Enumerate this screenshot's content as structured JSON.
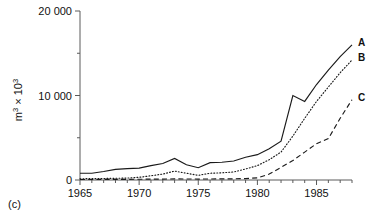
{
  "caption": "(c)",
  "chart_data": {
    "type": "line",
    "title": "",
    "xlabel": "",
    "ylabel": "m3 x 103",
    "ylabel_parts": {
      "base1": "m",
      "sup1": "3",
      "mid": " × 10",
      "sup2": "3"
    },
    "xlim": [
      1965,
      1988
    ],
    "ylim": [
      0,
      20000
    ],
    "grid": false,
    "legend_position": "right-end-of-lines",
    "y_ticks_major": [
      0,
      10000,
      20000
    ],
    "y_ticklabels": [
      "0",
      "10 000",
      "20 000"
    ],
    "y_ticks_minor": [
      5000,
      15000
    ],
    "x_ticks_major": [
      1965,
      1970,
      1975,
      1980,
      1985
    ],
    "x_ticklabels": [
      "1965",
      "1970",
      "1975",
      "1980",
      "1985"
    ],
    "x_ticks_minor": [
      1966,
      1967,
      1968,
      1969,
      1971,
      1972,
      1973,
      1974,
      1976,
      1977,
      1978,
      1979,
      1981,
      1982,
      1983,
      1984,
      1986,
      1987,
      1988
    ],
    "x": [
      1965,
      1966,
      1967,
      1968,
      1969,
      1970,
      1971,
      1972,
      1973,
      1974,
      1975,
      1976,
      1977,
      1978,
      1979,
      1980,
      1981,
      1982,
      1983,
      1984,
      1985,
      1986,
      1987,
      1988
    ],
    "series": [
      {
        "name": "A",
        "label": "A",
        "style": "solid",
        "color": "#1a1a1a",
        "values": [
          800,
          800,
          1000,
          1250,
          1350,
          1400,
          1700,
          1950,
          2550,
          1800,
          1450,
          2050,
          2100,
          2250,
          2700,
          3000,
          3700,
          4600,
          10000,
          9300,
          11300,
          13000,
          14600,
          16000
        ]
      },
      {
        "name": "B",
        "label": "B",
        "style": "dotted",
        "color": "#1a1a1a",
        "values": [
          150,
          160,
          180,
          200,
          230,
          320,
          500,
          700,
          1050,
          800,
          550,
          800,
          850,
          950,
          1300,
          1700,
          2400,
          3300,
          5200,
          7300,
          9300,
          11000,
          12700,
          14200
        ]
      },
      {
        "name": "C",
        "label": "C",
        "style": "dashed",
        "color": "#1a1a1a",
        "values": [
          60,
          60,
          70,
          70,
          80,
          90,
          100,
          110,
          130,
          120,
          110,
          120,
          130,
          140,
          170,
          250,
          700,
          1500,
          2300,
          3300,
          4300,
          4900,
          7300,
          9500
        ]
      }
    ]
  }
}
